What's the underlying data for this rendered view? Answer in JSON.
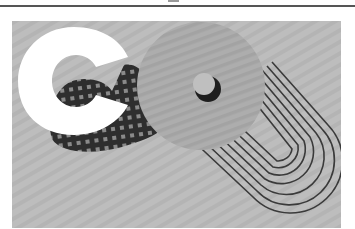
{
  "header": {
    "caption": "",
    "rule_color": "#555555"
  },
  "artwork": {
    "description": "Abstract graphic: large white letter C with dark checkered drop shadow, a gray striped disc with a small circle and dark crescent, and a U-shaped set of concentric dark stripes on a light gray striped background",
    "letter": "C",
    "colors": {
      "background": "#bdbdbd",
      "background_stripe": "#b3b3b3",
      "letter_fill": "#ffffff",
      "shadow_dark": "#2e2e2e",
      "shadow_check": "#8c8c8c",
      "disc_fill": "#acacac",
      "disc_stripe": "#a2a2a2",
      "small_circle": "#bfbfbf",
      "crescent": "#1e1e1e",
      "u_stripe": "#3a3a3a"
    },
    "u_stripe_count": 7
  }
}
